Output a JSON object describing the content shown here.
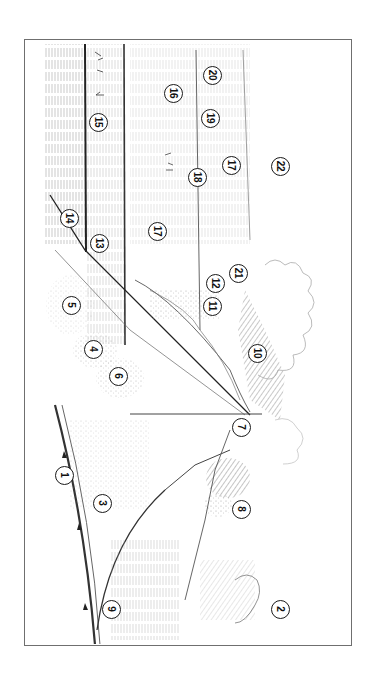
{
  "figure": {
    "type": "rotated line-drawing landscape illustration with numbered callouts",
    "orientation": "rotated 90 degrees clockwise",
    "frame_color": "#6f6f6f",
    "ink_color": "#1a1a1a",
    "callouts": [
      {
        "label": "1",
        "x": 64,
        "y": 475
      },
      {
        "label": "2",
        "x": 280,
        "y": 609
      },
      {
        "label": "3",
        "x": 102,
        "y": 503
      },
      {
        "label": "4",
        "x": 93,
        "y": 349
      },
      {
        "label": "5",
        "x": 71,
        "y": 305
      },
      {
        "label": "6",
        "x": 118,
        "y": 376
      },
      {
        "label": "7",
        "x": 241,
        "y": 427
      },
      {
        "label": "8",
        "x": 241,
        "y": 509
      },
      {
        "label": "9",
        "x": 111,
        "y": 609
      },
      {
        "label": "10",
        "x": 257,
        "y": 353
      },
      {
        "label": "11",
        "x": 212,
        "y": 306
      },
      {
        "label": "12",
        "x": 215,
        "y": 283
      },
      {
        "label": "13",
        "x": 99,
        "y": 243
      },
      {
        "label": "14",
        "x": 69,
        "y": 218
      },
      {
        "label": "15",
        "x": 98,
        "y": 122
      },
      {
        "label": "16",
        "x": 173,
        "y": 93
      },
      {
        "label": "17",
        "x": 157,
        "y": 231
      },
      {
        "label": "17",
        "x": 231,
        "y": 165
      },
      {
        "label": "18",
        "x": 197,
        "y": 177
      },
      {
        "label": "19",
        "x": 210,
        "y": 118
      },
      {
        "label": "20",
        "x": 212,
        "y": 75
      },
      {
        "label": "21",
        "x": 238,
        "y": 273
      },
      {
        "label": "22",
        "x": 280,
        "y": 166
      }
    ]
  }
}
